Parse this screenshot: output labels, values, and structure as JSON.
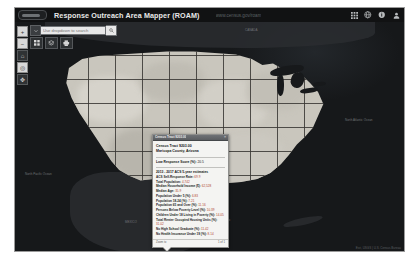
{
  "header": {
    "logo_name": "census-bureau-logo",
    "app_title": "Response Outreach Area Mapper (ROAM)",
    "url_text": "www.census.gov/roam",
    "icons": [
      {
        "name": "grid-icon",
        "label": "Apps"
      },
      {
        "name": "globe-icon",
        "label": "Language"
      },
      {
        "name": "info-icon",
        "label": "About"
      },
      {
        "name": "user-icon",
        "label": "Sign In"
      }
    ]
  },
  "map_controls": [
    {
      "name": "zoom-in-button",
      "label": "+"
    },
    {
      "name": "zoom-out-button",
      "label": "−"
    },
    {
      "name": "home-button",
      "label": "⌂"
    },
    {
      "name": "locate-button",
      "label": "◎"
    },
    {
      "name": "pan-button",
      "label": "✥"
    }
  ],
  "search": {
    "dropdown_name": "search-scope-dropdown",
    "placeholder": "Use dropdown to search",
    "value": "",
    "button_label": "Search"
  },
  "toolbar": {
    "buttons": [
      {
        "name": "basemap-gallery-button",
        "label": "Basemap Gallery"
      },
      {
        "name": "layer-list-button",
        "label": "Layer List"
      },
      {
        "name": "print-button",
        "label": "Print"
      }
    ]
  },
  "popup": {
    "title": "Census Tract 9203.00",
    "close_label": "×",
    "head_line1": "Census Tract 9203.00",
    "head_line2": "Maricopa County, Arizona",
    "lrs_label": "Low Response Score (%):",
    "lrs_value": "20.5",
    "source_label": "2013 - 2017 ACS 5-year estimates",
    "stats": [
      {
        "label": "ACS Self-Response Rate:",
        "value": "69.9"
      },
      {
        "label": "Total Population:",
        "value": "4,742"
      },
      {
        "label": "Median Household Income ($):",
        "value": "62,528"
      },
      {
        "label": "Median Age:",
        "value": "35.9"
      },
      {
        "label": "Population Under 5 (%):",
        "value": "6.83"
      },
      {
        "label": "Population 18-24 (%):",
        "value": "7.21"
      },
      {
        "label": "Population 65 and Over (%):",
        "value": "11.16"
      },
      {
        "label": "Persons Below Poverty Level (%):",
        "value": "10.39"
      },
      {
        "label": "Children Under 18 Living in Poverty (%):",
        "value": "14.05"
      },
      {
        "label": "Total Renter Occupied Housing Units (%):",
        "value": "31.02"
      },
      {
        "label": "No High School Graduate (%):",
        "value": "11.42"
      },
      {
        "label": "No Health Insurance Under 19 (%):",
        "value": "8.14"
      }
    ],
    "footer_left": "Zoom to",
    "footer_right": "1 of 1"
  },
  "map": {
    "labels": [
      {
        "name": "map-label-canada",
        "text": "CANADA",
        "x": 230,
        "y": 6
      },
      {
        "name": "map-label-mexico",
        "text": "MEXICO",
        "x": 110,
        "y": 198
      },
      {
        "name": "map-label-atlantic",
        "text": "North Atlantic Ocean",
        "x": 330,
        "y": 96
      },
      {
        "name": "map-label-pacific",
        "text": "North Pacific Ocean",
        "x": 18,
        "y": 150
      },
      {
        "name": "map-label-gulf",
        "text": "Gulf of Mexico",
        "x": 196,
        "y": 196
      }
    ],
    "scale_label": "500 mi",
    "attribution": "Esri, USGS | U.S. Census Bureau"
  },
  "colors": {
    "header_bg": "#111213",
    "map_water": "#16181a",
    "land": "#c9c6bd",
    "popup_bg": "#f4f4f2",
    "stat_value": "#b0452c"
  }
}
